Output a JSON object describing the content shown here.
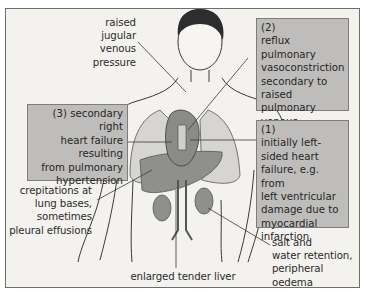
{
  "figure": {
    "type": "anatomical diagram"
  },
  "labels": {
    "jvp": [
      "raised",
      "jugular",
      "venous",
      "pressure"
    ],
    "crepitations": [
      "crepitations at",
      "lung bases,",
      "sometimes",
      "pleural effusions"
    ],
    "liver": "enlarged tender liver",
    "salt": [
      "salt and",
      "water retention,",
      "peripheral",
      "oedema"
    ]
  },
  "boxes": {
    "box2": {
      "number": "(2)",
      "lines": [
        "reflux pulmonary",
        "vasoconstriction",
        "secondary to",
        "raised pulmonary",
        "venous pressure"
      ]
    },
    "box1": {
      "number": "(1)",
      "lines": [
        "initially left-",
        "sided heart",
        "failure, e.g. from",
        "left ventricular",
        "damage due to",
        "myocardial",
        "infarction"
      ]
    },
    "box3": {
      "lines": [
        "(3) secondary right",
        "heart failure",
        "resulting",
        "from pulmonary",
        "hypertension"
      ]
    }
  },
  "colors": {
    "background": "#f3f2ef",
    "box_fill": "#bebdbb",
    "organ_fill": "#8f8f8d",
    "lung_fill": "#d6d5d3",
    "line": "#3a3a3a"
  }
}
